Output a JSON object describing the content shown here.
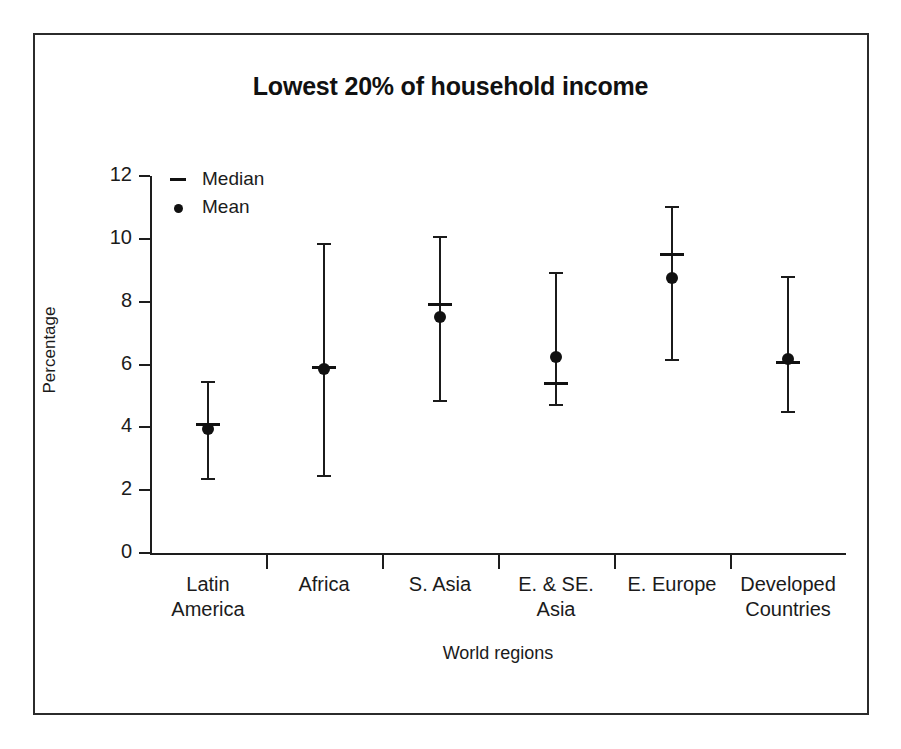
{
  "chart_data": {
    "type": "scatter",
    "title": "Lowest 20% of household income",
    "xlabel": "World regions",
    "ylabel": "Percentage",
    "ylim": [
      0,
      12
    ],
    "yticks": [
      0,
      2,
      4,
      6,
      8,
      10,
      12
    ],
    "grid": false,
    "legend_position": "top-left",
    "legend": [
      {
        "marker": "dash",
        "label": "Median"
      },
      {
        "marker": "dot",
        "label": "Mean"
      }
    ],
    "categories": [
      "Latin\nAmerica",
      "Africa",
      "S. Asia",
      "E. & SE.\nAsia",
      "E. Europe",
      "Developed\nCountries"
    ],
    "series": [
      {
        "name": "Median",
        "values": [
          4.1,
          5.9,
          7.9,
          5.4,
          9.5,
          6.05
        ]
      },
      {
        "name": "Mean",
        "values": [
          3.95,
          5.85,
          7.5,
          6.25,
          8.75,
          6.18
        ]
      },
      {
        "name": "Range high",
        "values": [
          5.45,
          9.85,
          10.05,
          8.9,
          11.0,
          8.8
        ]
      },
      {
        "name": "Range low",
        "values": [
          2.35,
          2.45,
          4.85,
          4.7,
          6.15,
          4.5
        ]
      }
    ],
    "points": [
      {
        "category": "Latin America",
        "low": 2.35,
        "median": 4.1,
        "mean": 3.95,
        "high": 5.45
      },
      {
        "category": "Africa",
        "low": 2.45,
        "median": 5.9,
        "mean": 5.85,
        "high": 9.85
      },
      {
        "category": "S. Asia",
        "low": 4.85,
        "median": 7.9,
        "mean": 7.5,
        "high": 10.05
      },
      {
        "category": "E. & SE. Asia",
        "low": 4.7,
        "median": 5.4,
        "mean": 6.25,
        "high": 8.9
      },
      {
        "category": "E. Europe",
        "low": 6.15,
        "median": 9.5,
        "mean": 8.75,
        "high": 11.0
      },
      {
        "category": "Developed Countries",
        "low": 4.5,
        "median": 6.05,
        "mean": 6.18,
        "high": 8.8
      }
    ],
    "colors": {
      "ink": "#1b1b1b",
      "background": "#ffffff",
      "frame": "#2b2b2b"
    }
  }
}
